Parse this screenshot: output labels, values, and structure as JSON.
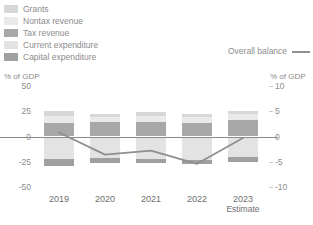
{
  "legend": {
    "items": [
      {
        "label": "Grants",
        "color": "#d7d7d7"
      },
      {
        "label": "Nontax revenue",
        "color": "#eaeaea"
      },
      {
        "label": "Tax revenue",
        "color": "#a8a8a8"
      },
      {
        "label": "Current expenditure",
        "color": "#e3e3e3"
      },
      {
        "label": "Capital expenditure",
        "color": "#a0a0a0"
      }
    ],
    "line_series": {
      "label": "Overall balance",
      "color": "#8f8f8f"
    }
  },
  "axes": {
    "left_unit": "% of GDP",
    "right_unit": "% of GDP",
    "left_ticks": [
      "50",
      "25",
      "0",
      "-25",
      "-50"
    ],
    "right_ticks": [
      "10",
      "5",
      "0",
      "-5",
      "-10"
    ]
  },
  "chart_data": {
    "type": "bar",
    "title": "",
    "subtitle": "",
    "xlabel": "",
    "ylabel": "% of GDP",
    "y2label": "% of GDP",
    "ylim": [
      -50,
      50
    ],
    "y2lim": [
      -10,
      10
    ],
    "grid": false,
    "legend_position": "top-left",
    "categories": [
      "2019",
      "2020",
      "2021",
      "2022",
      "2023"
    ],
    "category_notes": {
      "2023": "Estimate"
    },
    "stacked": true,
    "series": [
      {
        "name": "Tax revenue",
        "axis": "left",
        "color": "#a8a8a8",
        "values": [
          13.5,
          14.0,
          14.0,
          13.0,
          16.5
        ]
      },
      {
        "name": "Nontax revenue",
        "axis": "left",
        "color": "#eaeaea",
        "values": [
          6.5,
          5.0,
          6.5,
          6.0,
          5.5
        ]
      },
      {
        "name": "Grants",
        "axis": "left",
        "color": "#d7d7d7",
        "values": [
          5.0,
          3.5,
          4.0,
          3.5,
          3.5
        ]
      },
      {
        "name": "Current expenditure",
        "axis": "left",
        "color": "#e3e3e3",
        "values": [
          -22.5,
          -21.5,
          -22.0,
          -23.5,
          -20.5
        ]
      },
      {
        "name": "Capital expenditure",
        "axis": "left",
        "color": "#a0a0a0",
        "values": [
          -6.5,
          -4.5,
          -4.0,
          -4.0,
          -5.0
        ]
      }
    ],
    "line_series": {
      "name": "Overall balance",
      "axis": "right",
      "color": "#8f8f8f",
      "values": [
        0.8,
        -3.6,
        -2.8,
        -5.4,
        -0.3
      ]
    }
  }
}
